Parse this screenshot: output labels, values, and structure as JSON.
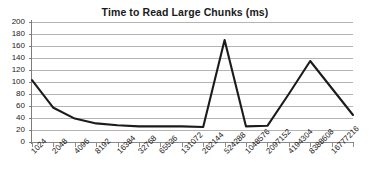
{
  "chart_data": {
    "type": "line",
    "title": "Time to Read Large Chunks (ms)",
    "xlabel": "",
    "ylabel": "",
    "ylim": [
      0,
      200
    ],
    "ytick_step": 20,
    "yticks": [
      0,
      20,
      40,
      60,
      80,
      100,
      120,
      140,
      160,
      180,
      200
    ],
    "grid": true,
    "legend": false,
    "categories": [
      "1024",
      "2048",
      "4096",
      "8192",
      "16384",
      "32768",
      "65536",
      "131072",
      "262144",
      "524288",
      "1048576",
      "2097152",
      "4194304",
      "8388608",
      "16777216",
      ""
    ],
    "values": [
      103,
      57,
      39,
      31,
      28,
      26,
      26,
      26,
      25,
      170,
      26,
      27,
      80,
      135,
      90,
      45
    ],
    "series": [
      {
        "name": "Time to Read Large Chunks (ms)",
        "color": "#1b1b1b",
        "values": [
          103,
          57,
          39,
          31,
          28,
          26,
          26,
          26,
          25,
          170,
          26,
          27,
          80,
          135,
          90,
          45
        ]
      }
    ],
    "annotations": [
      "Curve decays sharply from 103 ms at 1024 bytes to a plateau near 25 ms",
      "Spike to about 170 ms at 524288",
      "Second broad peak of about 135 ms at 8388608",
      "Final sample falls to about 45 ms"
    ]
  },
  "axis": {
    "y_unit": "ms",
    "x_unit": "bytes"
  },
  "style": {
    "background": "#ffffff",
    "gridline_color": "#b4b4b4",
    "axis_color": "#7d7d7d",
    "series_color": "#1b1b1b",
    "text_color": "#222222",
    "title_color": "#1a1a1a"
  }
}
